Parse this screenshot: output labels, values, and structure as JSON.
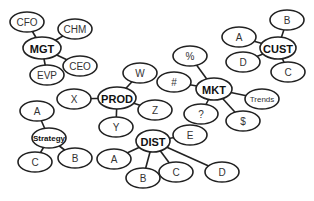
{
  "diagram": {
    "type": "mind-map",
    "colors": {
      "stroke": "#222222",
      "fill": "#ffffff",
      "text": "#333333"
    },
    "nodes": [
      {
        "id": "mgt",
        "label": "MGT",
        "x": 42,
        "y": 48,
        "rx": 19,
        "ry": 11,
        "style": "hub"
      },
      {
        "id": "cfo",
        "label": "CFO",
        "x": 27,
        "y": 22,
        "rx": 17,
        "ry": 10
      },
      {
        "id": "chm",
        "label": "CHM",
        "x": 75,
        "y": 29,
        "rx": 17,
        "ry": 10
      },
      {
        "id": "ceo",
        "label": "CEO",
        "x": 80,
        "y": 66,
        "rx": 17,
        "ry": 10
      },
      {
        "id": "evp",
        "label": "EVP",
        "x": 47,
        "y": 75,
        "rx": 17,
        "ry": 10
      },
      {
        "id": "prod",
        "label": "PROD",
        "x": 117,
        "y": 98,
        "rx": 19,
        "ry": 11,
        "style": "hub"
      },
      {
        "id": "x",
        "label": "X",
        "x": 74,
        "y": 99,
        "rx": 17,
        "ry": 10
      },
      {
        "id": "w",
        "label": "W",
        "x": 140,
        "y": 73,
        "rx": 17,
        "ry": 10
      },
      {
        "id": "z",
        "label": "Z",
        "x": 155,
        "y": 110,
        "rx": 17,
        "ry": 10
      },
      {
        "id": "y",
        "label": "Y",
        "x": 116,
        "y": 127,
        "rx": 17,
        "ry": 10
      },
      {
        "id": "strategy",
        "label": "Strategy",
        "x": 49,
        "y": 138,
        "rx": 17,
        "ry": 10,
        "style": "hub-small"
      },
      {
        "id": "strat-a",
        "label": "A",
        "x": 37,
        "y": 111,
        "rx": 17,
        "ry": 10
      },
      {
        "id": "strat-b",
        "label": "B",
        "x": 75,
        "y": 158,
        "rx": 17,
        "ry": 10
      },
      {
        "id": "strat-c",
        "label": "C",
        "x": 35,
        "y": 162,
        "rx": 17,
        "ry": 10
      },
      {
        "id": "dist",
        "label": "DIST",
        "x": 153,
        "y": 141,
        "rx": 17,
        "ry": 11,
        "style": "hub"
      },
      {
        "id": "dist-e",
        "label": "E",
        "x": 190,
        "y": 135,
        "rx": 17,
        "ry": 10
      },
      {
        "id": "dist-a",
        "label": "A",
        "x": 114,
        "y": 159,
        "rx": 17,
        "ry": 10
      },
      {
        "id": "dist-b",
        "label": "B",
        "x": 143,
        "y": 178,
        "rx": 17,
        "ry": 10
      },
      {
        "id": "dist-c",
        "label": "C",
        "x": 176,
        "y": 172,
        "rx": 17,
        "ry": 10
      },
      {
        "id": "dist-d",
        "label": "D",
        "x": 222,
        "y": 172,
        "rx": 17,
        "ry": 10
      },
      {
        "id": "mkt",
        "label": "MKT",
        "x": 214,
        "y": 89,
        "rx": 18,
        "ry": 11,
        "style": "hub"
      },
      {
        "id": "pct",
        "label": "%",
        "x": 190,
        "y": 56,
        "rx": 17,
        "ry": 10
      },
      {
        "id": "hash",
        "label": "#",
        "x": 174,
        "y": 82,
        "rx": 17,
        "ry": 10
      },
      {
        "id": "question",
        "label": "?",
        "x": 201,
        "y": 114,
        "rx": 17,
        "ry": 10
      },
      {
        "id": "dollar",
        "label": "$",
        "x": 243,
        "y": 121,
        "rx": 17,
        "ry": 10
      },
      {
        "id": "trends",
        "label": "Trends",
        "x": 262,
        "y": 99,
        "rx": 17,
        "ry": 10,
        "style": "small"
      },
      {
        "id": "cust",
        "label": "CUST",
        "x": 278,
        "y": 48,
        "rx": 18,
        "ry": 11,
        "style": "hub"
      },
      {
        "id": "cust-a",
        "label": "A",
        "x": 239,
        "y": 37,
        "rx": 17,
        "ry": 10
      },
      {
        "id": "cust-b",
        "label": "B",
        "x": 287,
        "y": 20,
        "rx": 17,
        "ry": 10
      },
      {
        "id": "cust-d",
        "label": "D",
        "x": 243,
        "y": 62,
        "rx": 17,
        "ry": 10
      },
      {
        "id": "cust-c",
        "label": "C",
        "x": 288,
        "y": 72,
        "rx": 17,
        "ry": 10
      }
    ],
    "edges": [
      [
        "mgt",
        "cfo"
      ],
      [
        "mgt",
        "chm"
      ],
      [
        "mgt",
        "ceo"
      ],
      [
        "mgt",
        "evp"
      ],
      [
        "prod",
        "x"
      ],
      [
        "prod",
        "w"
      ],
      [
        "prod",
        "z"
      ],
      [
        "prod",
        "y"
      ],
      [
        "strategy",
        "strat-a"
      ],
      [
        "strategy",
        "strat-b"
      ],
      [
        "strategy",
        "strat-c"
      ],
      [
        "dist",
        "dist-e"
      ],
      [
        "dist",
        "dist-a"
      ],
      [
        "dist",
        "dist-b"
      ],
      [
        "dist",
        "dist-c"
      ],
      [
        "dist",
        "dist-d"
      ],
      [
        "mkt",
        "pct"
      ],
      [
        "mkt",
        "hash"
      ],
      [
        "mkt",
        "question"
      ],
      [
        "mkt",
        "dollar"
      ],
      [
        "mkt",
        "trends"
      ],
      [
        "cust",
        "cust-a"
      ],
      [
        "cust",
        "cust-b"
      ],
      [
        "cust",
        "cust-d"
      ],
      [
        "cust",
        "cust-c"
      ]
    ]
  }
}
